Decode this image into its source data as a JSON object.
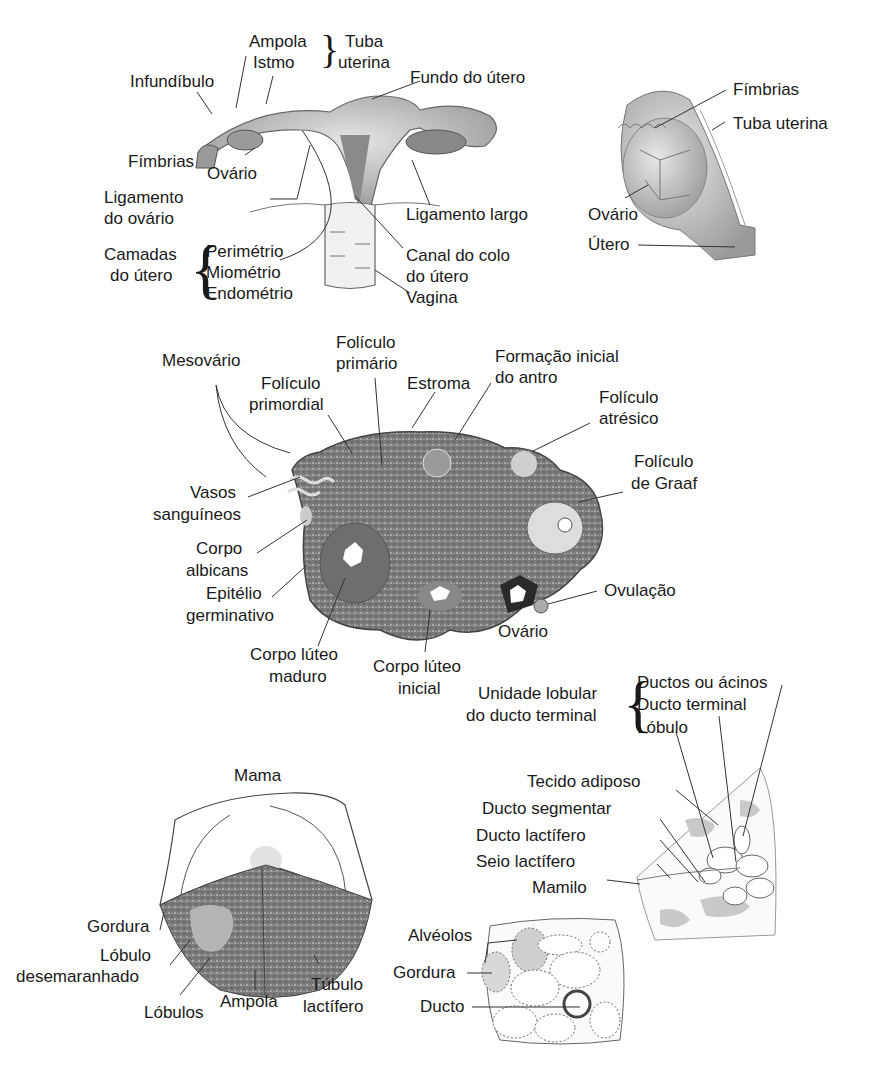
{
  "figure": {
    "uterus_panel": {
      "ampola": "Ampola",
      "istmo": "Istmo",
      "tuba_uterina_1": "Tuba",
      "tuba_uterina_2": "uterina",
      "infundibulo": "Infundíbulo",
      "fundo": "Fundo do útero",
      "fimbrias": "Fímbrias",
      "ovario": "Ovário",
      "ligamento_ovario_1": "Ligamento",
      "ligamento_ovario_2": "do ovário",
      "ligamento_largo": "Ligamento largo",
      "camadas_1": "Camadas",
      "camadas_2": "do útero",
      "perimetrio": "Perimétrio",
      "miometrio": "Miométrio",
      "endometrio": "Endométrio",
      "canal_1": "Canal do colo",
      "canal_2": "do útero",
      "vagina": "Vagina"
    },
    "side_panel": {
      "fimbrias": "Fímbrias",
      "tuba_uterina": "Tuba uterina",
      "ovario": "Ovário",
      "utero": "Útero"
    },
    "ovary_panel": {
      "mesovario": "Mesovário",
      "foliculo_primario_1": "Folículo",
      "foliculo_primario_2": "primário",
      "foliculo_primordial_1": "Folículo",
      "foliculo_primordial_2": "primordial",
      "estroma": "Estroma",
      "antro_1": "Formação inicial",
      "antro_2": "do antro",
      "atresico_1": "Folículo",
      "atresico_2": "atrésico",
      "graaf_1": "Folículo",
      "graaf_2": "de Graaf",
      "vasos_1": "Vasos",
      "vasos_2": "sanguíneos",
      "albicans_1": "Corpo",
      "albicans_2": "albicans",
      "epitelio_1": "Epitélio",
      "epitelio_2": "germinativo",
      "ovulacao": "Ovulação",
      "ovario": "Ovário",
      "luteo_maduro_1": "Corpo lúteo",
      "luteo_maduro_2": "maduro",
      "luteo_inicial_1": "Corpo lúteo",
      "luteo_inicial_2": "inicial"
    },
    "breast_side_panel": {
      "unidade_1": "Unidade lobular",
      "unidade_2": "do ducto terminal",
      "ductos_acinos": "Ductos ou ácinos",
      "ducto_terminal": "Ducto terminal",
      "lobulo": "Lóbulo",
      "tecido_adiposo": "Tecido adiposo",
      "ducto_segmentar": "Ducto segmentar",
      "ducto_lactifero": "Ducto lactífero",
      "seio_lactifero": "Seio lactífero",
      "mamilo": "Mamilo"
    },
    "breast_panel": {
      "mama": "Mama",
      "gordura": "Gordura",
      "lobulo_desem_1": "Lóbulo",
      "lobulo_desem_2": "desemaranhado",
      "lobulos": "Lóbulos",
      "ampola": "Ampola",
      "tubulo_1": "Túbulo",
      "tubulo_2": "lactífero"
    },
    "alveoli_panel": {
      "alveolos": "Alvéolos",
      "gordura": "Gordura",
      "ducto": "Ducto"
    }
  }
}
